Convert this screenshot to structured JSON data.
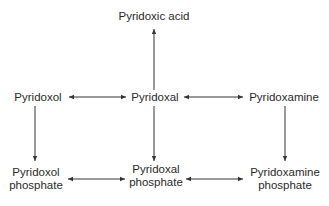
{
  "diagram": {
    "type": "reaction-pathway",
    "nodes": {
      "pyridoxic_acid": "Pyridoxic acid",
      "pyridoxol": "Pyridoxol",
      "pyridoxal": "Pyridoxal",
      "pyridoxamine": "Pyridoxamine",
      "pyridoxol_phosphate": [
        "Pyridoxol",
        "phosphate"
      ],
      "pyridoxal_phosphate": [
        "Pyridoxal",
        "phosphate"
      ],
      "pyridoxamine_phosphate": [
        "Pyridoxamine",
        "phosphate"
      ]
    },
    "edges": [
      {
        "from": "pyridoxal",
        "to": "pyridoxic_acid",
        "direction": "one-way"
      },
      {
        "from": "pyridoxol",
        "to": "pyridoxal",
        "direction": "two-way"
      },
      {
        "from": "pyridoxal",
        "to": "pyridoxamine",
        "direction": "two-way"
      },
      {
        "from": "pyridoxol",
        "to": "pyridoxol_phosphate",
        "direction": "one-way"
      },
      {
        "from": "pyridoxal",
        "to": "pyridoxal_phosphate",
        "direction": "one-way"
      },
      {
        "from": "pyridoxamine",
        "to": "pyridoxamine_phosphate",
        "direction": "one-way"
      },
      {
        "from": "pyridoxol_phosphate",
        "to": "pyridoxal_phosphate",
        "direction": "two-way"
      },
      {
        "from": "pyridoxal_phosphate",
        "to": "pyridoxamine_phosphate",
        "direction": "two-way"
      }
    ],
    "colors": {
      "text": "#2a2a2a",
      "arrow": "#333333",
      "background": "#ffffff"
    }
  }
}
